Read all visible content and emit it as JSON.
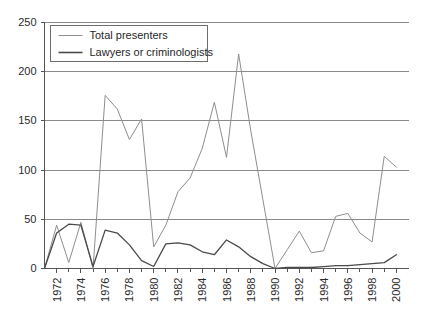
{
  "chart_data": {
    "type": "line",
    "title": "",
    "subtitle": "",
    "xlabel": "",
    "ylabel": "",
    "xlim": [
      1971,
      2001
    ],
    "ylim": [
      0,
      250
    ],
    "yticks": [
      0,
      50,
      100,
      150,
      200,
      250
    ],
    "xticks": [
      1972,
      1974,
      1976,
      1978,
      1980,
      1982,
      1984,
      1986,
      1988,
      1990,
      1992,
      1994,
      1996,
      1998,
      2000
    ],
    "xtick_labels": [
      "1972",
      "1974",
      "1976",
      "1978",
      "1980",
      "1982",
      "1984",
      "1986",
      "1988",
      "1990",
      "1992",
      "1994",
      "1996",
      "1998",
      "2000"
    ],
    "ytick_labels": [
      "0",
      "50",
      "100",
      "150",
      "200",
      "250"
    ],
    "grid": true,
    "grid_axis": "y",
    "legend_position": "top-left",
    "x": [
      1971,
      1972,
      1973,
      1974,
      1975,
      1976,
      1977,
      1978,
      1979,
      1980,
      1981,
      1982,
      1983,
      1984,
      1985,
      1986,
      1987,
      1988,
      1989,
      1990,
      1991,
      1992,
      1993,
      1994,
      1995,
      1996,
      1997,
      1998,
      1999,
      2000
    ],
    "series": [
      {
        "name": "Total presenters",
        "color": "#8e8e8e",
        "values": [
          0,
          44,
          6,
          47,
          0,
          176,
          162,
          131,
          152,
          22,
          44,
          78,
          92,
          122,
          169,
          113,
          218,
          140,
          70,
          0,
          19,
          38,
          16,
          18,
          53,
          56,
          36,
          27,
          114,
          103
        ]
      },
      {
        "name": "Lawyers or criminologists",
        "color": "#4a4a4a",
        "values": [
          0,
          36,
          45,
          44,
          2,
          39,
          36,
          24,
          8,
          2,
          25,
          26,
          24,
          17,
          14,
          29,
          22,
          12,
          5,
          0,
          1,
          1,
          1,
          2,
          3,
          3,
          4,
          5,
          6,
          14
        ]
      }
    ]
  },
  "legend": {
    "entries": [
      {
        "label": "Total presenters"
      },
      {
        "label": "Lawyers or criminologists"
      }
    ]
  },
  "axes": {
    "y_label_250": "250",
    "y_label_200": "200",
    "y_label_150": "150",
    "y_label_100": "100",
    "y_label_50": "50",
    "y_label_0": "0"
  }
}
